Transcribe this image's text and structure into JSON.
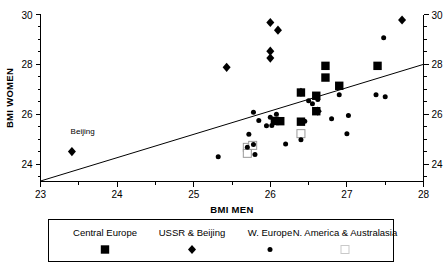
{
  "chart_data": {
    "type": "scatter",
    "title": "",
    "xlabel": "BMI MEN",
    "ylabel": "BMI WOMEN",
    "xlim": [
      23,
      28
    ],
    "ylim": [
      23.3,
      30
    ],
    "xticks": [
      "23",
      "24",
      "25",
      "26",
      "27",
      "28"
    ],
    "yticks": [
      "24",
      "26",
      "28",
      "30"
    ],
    "x_minor_step": 0.5,
    "y_minor_step": 0.5,
    "grid": false,
    "right_axis_visible": true,
    "right_yticks": [
      "24",
      "26",
      "28",
      "30"
    ],
    "legend": {
      "position": "below-plot",
      "entries": [
        {
          "label": "Central Europe",
          "marker": "filled-square"
        },
        {
          "label": "USSR & Beijing",
          "marker": "filled-diamond"
        },
        {
          "label": "W. Europe",
          "marker": "filled-dot"
        },
        {
          "label": "N. America & Australasia",
          "marker": "open-square"
        }
      ]
    },
    "annotations": [
      {
        "text": "Beijing",
        "x": 23.55,
        "y": 25.2
      }
    ],
    "reference_line": {
      "name": "identity-trend-line",
      "x1": 23.0,
      "y1": 23.32,
      "x2": 28.0,
      "y2": 28.0
    },
    "series": [
      {
        "name": "Central Europe",
        "marker": "filled-square",
        "points": [
          [
            26.13,
            25.72
          ],
          [
            26.4,
            26.87
          ],
          [
            26.4,
            25.7
          ],
          [
            26.6,
            26.74
          ],
          [
            26.6,
            26.12
          ],
          [
            26.72,
            27.94
          ],
          [
            26.72,
            27.47
          ],
          [
            26.9,
            27.14
          ],
          [
            27.4,
            27.94
          ],
          [
            26.06,
            25.73
          ]
        ]
      },
      {
        "name": "USSR & Beijing",
        "marker": "filled-diamond",
        "points": [
          [
            23.41,
            24.5
          ],
          [
            25.43,
            27.88
          ],
          [
            26.0,
            29.68
          ],
          [
            26.1,
            29.37
          ],
          [
            26.0,
            28.53
          ],
          [
            26.0,
            28.25
          ],
          [
            26.4,
            26.88
          ],
          [
            26.62,
            26.12
          ],
          [
            27.72,
            29.78
          ]
        ]
      },
      {
        "name": "W. Europe",
        "marker": "filled-dot",
        "points": [
          [
            25.32,
            24.29
          ],
          [
            25.7,
            24.67
          ],
          [
            25.78,
            24.78
          ],
          [
            25.8,
            24.38
          ],
          [
            25.72,
            25.2
          ],
          [
            25.78,
            26.08
          ],
          [
            25.85,
            25.75
          ],
          [
            25.95,
            25.54
          ],
          [
            26.0,
            25.88
          ],
          [
            26.02,
            25.55
          ],
          [
            26.08,
            26.0
          ],
          [
            26.2,
            24.8
          ],
          [
            26.4,
            24.97
          ],
          [
            26.5,
            26.54
          ],
          [
            26.55,
            26.42
          ],
          [
            26.62,
            26.59
          ],
          [
            26.8,
            25.82
          ],
          [
            26.9,
            26.78
          ],
          [
            27.02,
            25.95
          ],
          [
            27.0,
            25.22
          ],
          [
            27.38,
            26.78
          ],
          [
            27.5,
            26.7
          ],
          [
            27.48,
            29.07
          ],
          [
            26.45,
            25.72
          ]
        ]
      },
      {
        "name": "N. America & Australasia",
        "marker": "open-square",
        "points": [
          [
            25.7,
            24.67
          ],
          [
            25.7,
            24.43
          ],
          [
            25.77,
            24.75
          ],
          [
            26.4,
            25.22
          ]
        ]
      }
    ]
  },
  "axes": {
    "x_title": "BMI MEN",
    "y_title": "BMI WOMEN"
  }
}
